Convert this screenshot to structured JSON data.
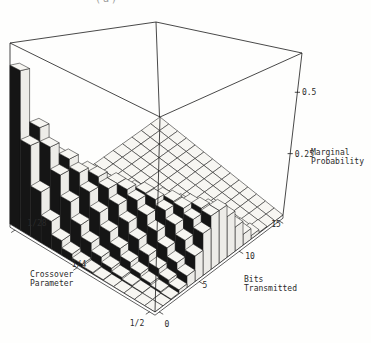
{
  "figure": {
    "partial_top_caption": "(a)"
  },
  "chart_data": {
    "type": "bar",
    "subtype": "bar3d",
    "title": "",
    "x_axis": {
      "label_lines": [
        "Bits",
        "Transmitted"
      ],
      "n_bins": 16,
      "ticks": [
        {
          "label": "0",
          "bit": 0
        },
        {
          "label": "5",
          "bit": 5
        },
        {
          "label": "10",
          "bit": 10
        },
        {
          "label": "15",
          "bit": 15
        }
      ]
    },
    "y_axis": {
      "label_lines": [
        "Crossover",
        "Parameter"
      ],
      "n_rows": 14,
      "ticks": [
        {
          "label": "1/2",
          "row": 0
        },
        {
          "label": "1/4",
          "row": 7
        },
        {
          "label": "1/28",
          "row": 13
        }
      ]
    },
    "z_axis": {
      "label_lines": [
        "Marginal",
        "Probability"
      ],
      "zlim": [
        0,
        0.66
      ],
      "ticks": [
        {
          "label": "0.25",
          "value": 0.25
        },
        {
          "label": "0.5",
          "value": 0.5
        }
      ]
    },
    "series": [
      {
        "crossover": "1/2",
        "values": [
          0.0,
          0.0005,
          0.0032,
          0.0139,
          0.0417,
          0.0916,
          0.1527,
          0.1964,
          0.1964,
          0.1527,
          0.0916,
          0.0417,
          0.0139,
          0.0032,
          0.0005,
          0.0
        ]
      },
      {
        "crossover": "13/28",
        "values": [
          0.0001,
          0.0011,
          0.0068,
          0.0254,
          0.0661,
          0.126,
          0.1821,
          0.203,
          0.1759,
          0.1186,
          0.0617,
          0.0243,
          0.007,
          0.0014,
          0.0002,
          0.0
        ]
      },
      {
        "crossover": "3/7",
        "values": [
          0.0002,
          0.0025,
          0.0134,
          0.0434,
          0.0977,
          0.1612,
          0.2015,
          0.1943,
          0.1458,
          0.085,
          0.0383,
          0.0131,
          0.0033,
          0.0006,
          0.0001,
          0.0
        ]
      },
      {
        "crossover": "11/28",
        "values": [
          0.0006,
          0.0054,
          0.0247,
          0.0688,
          0.1343,
          0.1912,
          0.2062,
          0.1716,
          0.111,
          0.0559,
          0.0217,
          0.0064,
          0.0014,
          0.0002,
          0.0,
          0.0
        ]
      },
      {
        "crossover": "5/14",
        "values": [
          0.0013,
          0.011,
          0.043,
          0.1032,
          0.1721,
          0.2104,
          0.1948,
          0.1391,
          0.0773,
          0.0334,
          0.0111,
          0.0028,
          0.0005,
          0.0001,
          0.0,
          0.0
        ]
      },
      {
        "crossover": "9/28",
        "values": [
          0.003,
          0.0212,
          0.0702,
          0.144,
          0.2046,
          0.2133,
          0.1683,
          0.1025,
          0.0486,
          0.0179,
          0.0051,
          0.0011,
          0.0002,
          0.0,
          0.0,
          0.0
        ]
      },
      {
        "crossover": "2/7",
        "values": [
          0.0064,
          0.0386,
          0.108,
          0.1871,
          0.2245,
          0.1976,
          0.1317,
          0.0678,
          0.0271,
          0.0084,
          0.002,
          0.0004,
          0.0,
          0.0,
          0.0,
          0.0
        ]
      },
      {
        "crossover": "1/4",
        "values": [
          0.0134,
          0.0668,
          0.1559,
          0.2252,
          0.2252,
          0.1651,
          0.0917,
          0.0393,
          0.0131,
          0.0034,
          0.0007,
          0.0001,
          0.0,
          0.0,
          0.0,
          0.0
        ]
      },
      {
        "crossover": "3/14",
        "values": [
          0.0268,
          0.1099,
          0.2097,
          0.2479,
          0.2028,
          0.1217,
          0.0553,
          0.0194,
          0.0053,
          0.0011,
          0.0002,
          0.0,
          0.0,
          0.0,
          0.0,
          0.0
        ]
      },
      {
        "crossover": "5/28",
        "values": [
          0.0523,
          0.1707,
          0.2595,
          0.2445,
          0.1594,
          0.0763,
          0.0276,
          0.0077,
          0.0017,
          0.0003,
          0.0,
          0.0,
          0.0,
          0.0,
          0.0,
          0.0
        ]
      },
      {
        "crossover": "1/7",
        "values": [
          0.099,
          0.2476,
          0.2889,
          0.2086,
          0.1043,
          0.0383,
          0.0106,
          0.0023,
          0.0004,
          0.0001,
          0.0,
          0.0,
          0.0,
          0.0,
          0.0,
          0.0
        ]
      },
      {
        "crossover": "3/28",
        "values": [
          0.1827,
          0.3289,
          0.2762,
          0.1437,
          0.0517,
          0.0137,
          0.0027,
          0.0004,
          0.0001,
          0.0,
          0.0,
          0.0,
          0.0,
          0.0,
          0.0,
          0.0
        ]
      },
      {
        "crossover": "1/14",
        "values": [
          0.329,
          0.3797,
          0.2044,
          0.0681,
          0.0157,
          0.0027,
          0.0003,
          0.0,
          0.0,
          0.0,
          0.0,
          0.0,
          0.0,
          0.0,
          0.0,
          0.0
        ]
      },
      {
        "crossover": "1/28",
        "values": [
          0.5795,
          0.322,
          0.0835,
          0.0134,
          0.0015,
          0.0001,
          0.0,
          0.0,
          0.0,
          0.0,
          0.0,
          0.0,
          0.0,
          0.0,
          0.0,
          0.0
        ]
      }
    ]
  },
  "style": {
    "top_face": "#f7f6f2",
    "front_face": "#edece8",
    "dark_face": "#151515",
    "line": "#1b1b1b",
    "text": "#2a2a2a"
  }
}
